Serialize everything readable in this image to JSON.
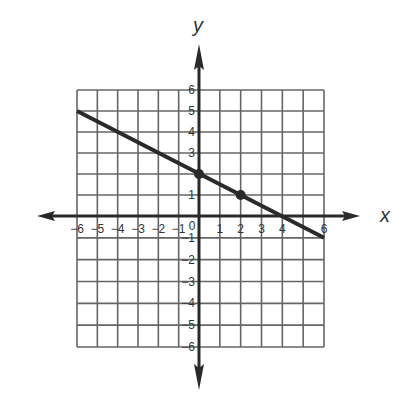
{
  "chart_data": {
    "type": "line",
    "title": "",
    "xlabel": "x",
    "ylabel": "y",
    "xlim": [
      -6,
      6
    ],
    "ylim": [
      -6,
      6
    ],
    "grid": true,
    "x_ticks": [
      -6,
      -5,
      -4,
      -3,
      -2,
      -1,
      0,
      1,
      2,
      3,
      4,
      5,
      6
    ],
    "y_ticks": [
      -6,
      -5,
      -4,
      -3,
      -2,
      -1,
      0,
      1,
      2,
      3,
      4,
      5,
      6
    ],
    "x_tick_labels": [
      "−6",
      "−5",
      "−4",
      "−3",
      "−2",
      "−1",
      "0",
      "1",
      "2",
      "3",
      "4",
      "6"
    ],
    "y_tick_labels": [
      "6",
      "5",
      "4",
      "3",
      "2",
      "1",
      "−1",
      "−2",
      "−3",
      "−4",
      "−5",
      "−6"
    ],
    "series": [
      {
        "name": "line",
        "equation": "y = -1/2 x + 2",
        "x": [
          -6,
          6
        ],
        "y": [
          5,
          -1
        ]
      }
    ],
    "points": [
      {
        "x": 0,
        "y": 2
      },
      {
        "x": 2,
        "y": 1
      }
    ],
    "colors": {
      "line": "#2a2a2a",
      "grid": "#555555",
      "axes": "#2a2a2a"
    }
  },
  "labels": {
    "x_axis": "x",
    "y_axis": "y",
    "origin": "0"
  }
}
